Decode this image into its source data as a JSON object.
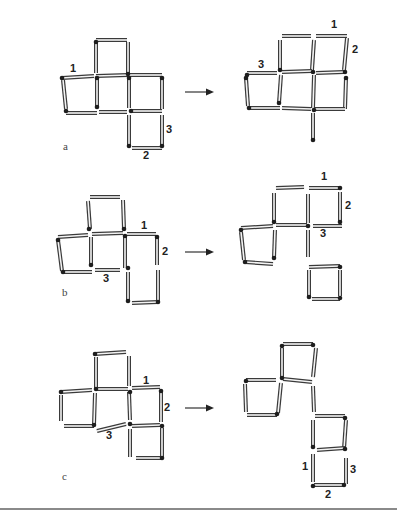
{
  "figure": {
    "panels": [
      {
        "id": "a",
        "label": "a",
        "label_pos": [
          63,
          150
        ],
        "arrow": {
          "x1": 185,
          "x2": 214,
          "y": 92
        },
        "before": {
          "sticks": [
            [
              96,
              40,
              127,
              40
            ],
            [
              96,
              42,
              96,
              73
            ],
            [
              128,
              42,
              128,
              73
            ],
            [
              62,
              78,
              94,
              76
            ],
            [
              96,
              76,
              128,
              75
            ],
            [
              130,
              75,
              162,
              75
            ],
            [
              63,
              80,
              66,
              109
            ],
            [
              97,
              78,
              97,
              107
            ],
            [
              129,
              78,
              129,
              108
            ],
            [
              162,
              78,
              162,
              109
            ],
            [
              66,
              113,
              97,
              113
            ],
            [
              99,
              112,
              127,
              112
            ],
            [
              131,
              111,
              162,
              111
            ],
            [
              129,
              115,
              129,
              146
            ],
            [
              162,
              115,
              162,
              146
            ],
            [
              132,
              148,
              162,
              148
            ]
          ],
          "heads": [
            [
              96,
              42
            ],
            [
              128,
              74
            ],
            [
              62,
              78
            ],
            [
              66,
              111
            ],
            [
              97,
              107
            ],
            [
              97,
              78
            ],
            [
              129,
              78
            ],
            [
              131,
              111
            ],
            [
              162,
              78
            ],
            [
              129,
              146
            ],
            [
              162,
              146
            ]
          ],
          "numbers": [
            {
              "text": "1",
              "x": 70,
              "y": 72
            },
            {
              "text": "3",
              "x": 166,
              "y": 133
            },
            {
              "text": "2",
              "x": 143,
              "y": 159
            }
          ]
        },
        "after": {
          "sticks": [
            [
              282,
              36,
              311,
              36
            ],
            [
              316,
              36,
              347,
              36
            ],
            [
              280,
              40,
              280,
              70
            ],
            [
              314,
              40,
              312,
              70
            ],
            [
              347,
              38,
              344,
              70
            ],
            [
              247,
              73,
              277,
              73
            ],
            [
              282,
              72,
              312,
              71
            ],
            [
              316,
              73,
              344,
              72
            ],
            [
              246,
              78,
              248,
              106
            ],
            [
              281,
              75,
              279,
              103
            ],
            [
              314,
              75,
              313,
              108
            ],
            [
              346,
              78,
              345,
              109
            ],
            [
              249,
              108,
              280,
              108
            ],
            [
              282,
              108,
              311,
              109
            ],
            [
              315,
              109,
              345,
              109
            ],
            [
              313,
              113,
              313,
              140
            ]
          ],
          "heads": [
            [
              280,
              70
            ],
            [
              247,
              75
            ],
            [
              246,
              78
            ],
            [
              279,
              103
            ],
            [
              249,
              108
            ],
            [
              313,
              72
            ],
            [
              314,
              110
            ],
            [
              346,
              78
            ],
            [
              313,
              140
            ],
            [
              345,
              72
            ]
          ],
          "numbers": [
            {
              "text": "1",
              "x": 331,
              "y": 28
            },
            {
              "text": "2",
              "x": 352,
              "y": 53
            },
            {
              "text": "3",
              "x": 258,
              "y": 68
            }
          ]
        }
      },
      {
        "id": "b",
        "label": "b",
        "label_pos": [
          62,
          296
        ],
        "arrow": {
          "x1": 185,
          "x2": 214,
          "y": 252
        },
        "before": {
          "sticks": [
            [
              90,
              197,
              120,
              197
            ],
            [
              88,
              201,
              90,
              229
            ],
            [
              123,
              200,
              124,
              229
            ],
            [
              58,
              237,
              88,
              235
            ],
            [
              92,
              234,
              123,
              233
            ],
            [
              127,
              234,
              156,
              234
            ],
            [
              58,
              240,
              62,
              271
            ],
            [
              91,
              237,
              91,
              265
            ],
            [
              125,
              236,
              125,
              268
            ],
            [
              157,
              237,
              157,
              265
            ],
            [
              63,
              272,
              92,
              272
            ],
            [
              95,
              270,
              120,
              270
            ],
            [
              128,
              272,
              128,
              301
            ],
            [
              158,
              270,
              158,
              301
            ],
            [
              132,
              303,
              158,
              302
            ]
          ],
          "heads": [
            [
              58,
              240
            ],
            [
              89,
              229
            ],
            [
              124,
              229
            ],
            [
              91,
              265
            ],
            [
              63,
              272
            ],
            [
              125,
              236
            ],
            [
              128,
              268
            ],
            [
              157,
              237
            ],
            [
              128,
              301
            ],
            [
              158,
              302
            ]
          ],
          "numbers": [
            {
              "text": "1",
              "x": 141,
              "y": 229
            },
            {
              "text": "2",
              "x": 162,
              "y": 255
            },
            {
              "text": "3",
              "x": 103,
              "y": 282
            }
          ]
        },
        "after": {
          "sticks": [
            [
              276,
              188,
              304,
              187
            ],
            [
              309,
              188,
              339,
              188
            ],
            [
              274,
              193,
              274,
              222
            ],
            [
              308,
              194,
              308,
              223
            ],
            [
              340,
              192,
              340,
              222
            ],
            [
              241,
              228,
              273,
              226
            ],
            [
              276,
              225,
              307,
              225
            ],
            [
              313,
              226,
              342,
              226
            ],
            [
              241,
              232,
              244,
              260
            ],
            [
              275,
              230,
              274,
              258
            ],
            [
              308,
              230,
              308,
              257
            ],
            [
              245,
              262,
              273,
              264
            ],
            [
              309,
              267,
              340,
              266
            ],
            [
              309,
              270,
              309,
              297
            ],
            [
              340,
              270,
              340,
              296
            ],
            [
              312,
              299,
              340,
              299
            ]
          ],
          "heads": [
            [
              274,
              222
            ],
            [
              241,
              230
            ],
            [
              274,
              258
            ],
            [
              245,
              262
            ],
            [
              308,
              226
            ],
            [
              340,
              222
            ],
            [
              340,
              188
            ],
            [
              309,
              297
            ],
            [
              340,
              298
            ],
            [
              340,
              267
            ]
          ],
          "numbers": [
            {
              "text": "1",
              "x": 321,
              "y": 180
            },
            {
              "text": "2",
              "x": 345,
              "y": 209
            },
            {
              "text": "3",
              "x": 320,
              "y": 237
            }
          ]
        }
      },
      {
        "id": "c",
        "label": "c",
        "label_pos": [
          62,
          480
        ],
        "arrow": {
          "x1": 185,
          "x2": 214,
          "y": 408
        },
        "before": {
          "sticks": [
            [
              95,
              354,
              126,
              352
            ],
            [
              96,
              357,
              96,
              388
            ],
            [
              129,
              356,
              129,
              386
            ],
            [
              61,
              392,
              92,
              390
            ],
            [
              97,
              389,
              128,
              389
            ],
            [
              132,
              388,
              160,
              387
            ],
            [
              61,
              395,
              61,
              421
            ],
            [
              95,
              393,
              94,
              425
            ],
            [
              129,
              392,
              130,
              420
            ],
            [
              161,
              391,
              161,
              422
            ],
            [
              64,
              426,
              94,
              426
            ],
            [
              132,
              426,
              160,
              425
            ],
            [
              97,
              431,
              126,
              424
            ],
            [
              130,
              429,
              130,
              457
            ],
            [
              162,
              428,
              162,
              458
            ],
            [
              136,
              458,
              162,
              458
            ]
          ],
          "heads": [
            [
              95,
              354
            ],
            [
              96,
              389
            ],
            [
              61,
              392
            ],
            [
              94,
              425
            ],
            [
              130,
              392
            ],
            [
              161,
              391
            ],
            [
              130,
              424
            ],
            [
              162,
              426
            ],
            [
              162,
              458
            ]
          ],
          "numbers": [
            {
              "text": "1",
              "x": 143,
              "y": 384
            },
            {
              "text": "2",
              "x": 164,
              "y": 411
            },
            {
              "text": "3",
              "x": 106,
              "y": 439
            }
          ]
        },
        "after": {
          "sticks": [
            [
              283,
              344,
              313,
              344
            ],
            [
              282,
              348,
              282,
              378
            ],
            [
              316,
              348,
              313,
              377
            ],
            [
              246,
              380,
              276,
              380
            ],
            [
              283,
              379,
              312,
              382
            ],
            [
              245,
              384,
              246,
              412
            ],
            [
              281,
              383,
              278,
              413
            ],
            [
              313,
              386,
              314,
              412
            ],
            [
              247,
              415,
              277,
              415
            ],
            [
              315,
              416,
              345,
              416
            ],
            [
              313,
              420,
              313,
              447
            ],
            [
              346,
              420,
              344,
              449
            ],
            [
              317,
              450,
              345,
              448
            ],
            [
              313,
              454,
              313,
              482
            ],
            [
              346,
              458,
              346,
              484
            ],
            [
              314,
              485,
              344,
              485
            ]
          ],
          "heads": [
            [
              282,
              346
            ],
            [
              313,
              345
            ],
            [
              282,
              378
            ],
            [
              246,
              381
            ],
            [
              277,
              414
            ],
            [
              345,
              418
            ],
            [
              313,
              447
            ],
            [
              345,
              449
            ],
            [
              313,
              486
            ],
            [
              344,
              485
            ]
          ],
          "numbers": [
            {
              "text": "1",
              "x": 302,
              "y": 470
            },
            {
              "text": "2",
              "x": 325,
              "y": 498
            },
            {
              "text": "3",
              "x": 350,
              "y": 473
            }
          ]
        }
      }
    ]
  }
}
